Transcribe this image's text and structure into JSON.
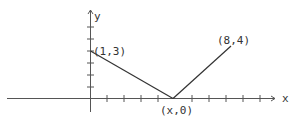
{
  "diagram": {
    "type": "coordinate-plane-sketch",
    "axes": {
      "x_label": "x",
      "y_label": "y",
      "x_tick_count_positive": 11,
      "y_tick_count_positive": 6
    },
    "points": [
      {
        "label": "(1,3)",
        "x": 1,
        "y": 3
      },
      {
        "label": "(x,0)",
        "x": "x",
        "y": 0
      },
      {
        "label": "(8,4)",
        "x": 8,
        "y": 4
      }
    ],
    "segments": [
      {
        "from": "(1,3)",
        "to": "(x,0)"
      },
      {
        "from": "(x,0)",
        "to": "(8,4)"
      }
    ],
    "colors": {
      "axis": "#555555",
      "line": "#333333",
      "text": "#333333"
    }
  }
}
